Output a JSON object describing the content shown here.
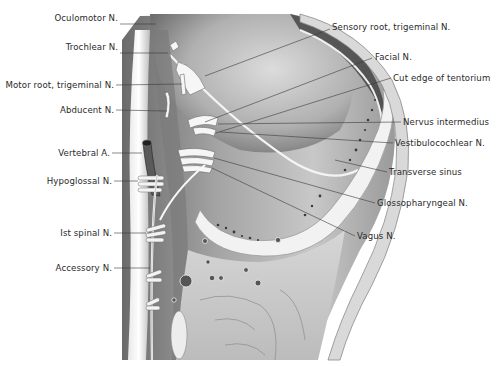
{
  "figure": {
    "labels_left": [
      {
        "text": "Oculomotor N.",
        "x": 118,
        "y": 18
      },
      {
        "text": "Trochlear N.",
        "x": 118,
        "y": 47
      },
      {
        "text": "Motor root, trigeminal N.",
        "x": 114,
        "y": 82
      },
      {
        "text": "Abducent N.",
        "x": 114,
        "y": 108
      },
      {
        "text": "Vertebral A.",
        "x": 110,
        "y": 150
      },
      {
        "text": "Hypoglossal N.",
        "x": 112,
        "y": 181
      },
      {
        "text": "Ist spinal N.",
        "x": 112,
        "y": 233
      },
      {
        "text": "Accessory N.",
        "x": 112,
        "y": 268
      }
    ],
    "labels_right": [
      {
        "text": "Sensory root, trigeminal N.",
        "x": 332,
        "y": 24
      },
      {
        "text": "Facial N.",
        "x": 375,
        "y": 53
      },
      {
        "text": "Cut edge of tentorium",
        "x": 393,
        "y": 74
      },
      {
        "text": "Nervus intermedius",
        "x": 403,
        "y": 118
      },
      {
        "text": "Vestibulocochlear N.",
        "x": 395,
        "y": 139
      },
      {
        "text": "Transverse sinus",
        "x": 389,
        "y": 168
      },
      {
        "text": "Glossopharyngeal N.",
        "x": 377,
        "y": 199
      },
      {
        "text": "Vagus N.",
        "x": 357,
        "y": 232
      }
    ]
  }
}
